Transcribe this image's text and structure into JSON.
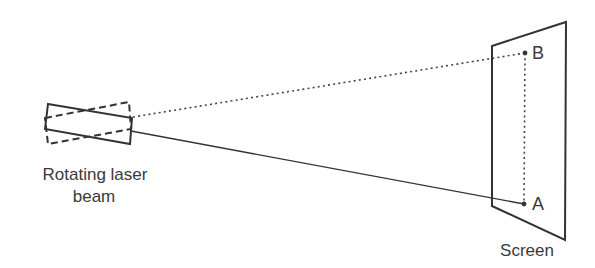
{
  "diagram": {
    "colors": {
      "line": "#333333",
      "text": "#3a3a3a",
      "background": "#ffffff"
    },
    "labels": {
      "source_line1": "Rotating laser",
      "source_line2": "beam",
      "screen": "Screen",
      "point_b": "B",
      "point_a": "A"
    },
    "laser": {
      "solid_rect": [
        [
          48,
          104
        ],
        [
          132,
          118
        ],
        [
          130,
          144
        ],
        [
          45,
          129
        ]
      ],
      "dashed_rect": [
        [
          45,
          118
        ],
        [
          129,
          102
        ],
        [
          131,
          129
        ],
        [
          48,
          144
        ]
      ]
    },
    "screen": {
      "polygon": [
        [
          492,
          46
        ],
        [
          566,
          22
        ],
        [
          565,
          240
        ],
        [
          492,
          206
        ]
      ]
    },
    "beams": {
      "dotted_to_b": {
        "from": [
          133,
          117
        ],
        "to": [
          525,
          53
        ]
      },
      "solid_to_a": {
        "from": [
          131,
          131
        ],
        "to": [
          524,
          204
        ]
      }
    },
    "points": {
      "b": [
        525,
        53
      ],
      "a": [
        524,
        204
      ]
    },
    "path_b_to_a": {
      "from": [
        525,
        53
      ],
      "to": [
        524,
        204
      ],
      "style": "dotted"
    }
  }
}
